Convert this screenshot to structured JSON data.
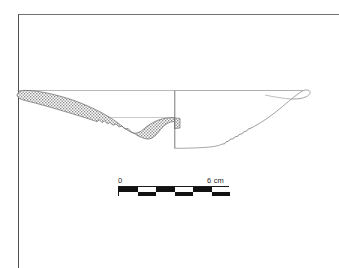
{
  "figure": {
    "kind": "archaeological-vessel-profile-drawing",
    "background_color": "#ffffff",
    "frame_color": "#6f7276",
    "ink_color": "#555555",
    "hatch_color": "#777777",
    "width_px": 339,
    "height_px": 268
  },
  "drawing": {
    "object_type": "shallow-bowl-plate-profile",
    "left_half": "hatched cross-section",
    "right_half": "outline exterior profile",
    "center_axis": "vertical section line",
    "rim_left_tip": "rounded flaring rim",
    "rim_right_tip": "rounded everted rim"
  },
  "scalebar": {
    "start_label": "0",
    "end_label": "6 cm",
    "units": "cm",
    "min_value": 0,
    "max_value": 6,
    "segments": 6,
    "segment_colors": [
      "#121212",
      "#ffffff",
      "#121212",
      "#ffffff",
      "#121212",
      "#ffffff"
    ],
    "bar_color": "#121212",
    "outline_color": "#1a1a1a"
  }
}
